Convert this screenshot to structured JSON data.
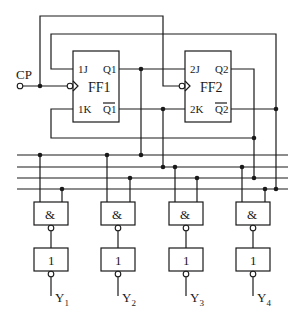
{
  "diagram": {
    "type": "digital-logic-circuit",
    "clock_input": {
      "label": "CP"
    },
    "flip_flops": [
      {
        "name": "FF1",
        "inputs": [
          "1J",
          "1K"
        ],
        "outputs": [
          "Q1",
          "Q1"
        ],
        "output_bar": [
          false,
          true
        ]
      },
      {
        "name": "FF2",
        "inputs": [
          "2J",
          "2K"
        ],
        "outputs": [
          "Q2",
          "Q2"
        ],
        "output_bar": [
          false,
          true
        ]
      }
    ],
    "bus_lines": [
      "Q1",
      "Q1_bar",
      "Q2",
      "Q2_bar"
    ],
    "decoder": {
      "nand_gates": [
        {
          "symbol": "&",
          "inputs": [
            "Q1",
            "Q2_bar"
          ]
        },
        {
          "symbol": "&",
          "inputs": [
            "Q1",
            "Q2"
          ]
        },
        {
          "symbol": "&",
          "inputs": [
            "Q1_bar",
            "Q2"
          ]
        },
        {
          "symbol": "&",
          "inputs": [
            "Q1_bar",
            "Q2_bar"
          ]
        }
      ],
      "inverters": [
        {
          "symbol": "1"
        },
        {
          "symbol": "1"
        },
        {
          "symbol": "1"
        },
        {
          "symbol": "1"
        }
      ],
      "outputs": [
        {
          "label": "Y",
          "sub": "1"
        },
        {
          "label": "Y",
          "sub": "2"
        },
        {
          "label": "Y",
          "sub": "3"
        },
        {
          "label": "Y",
          "sub": "4"
        }
      ]
    },
    "connections": [
      "CP -> FF1.C1, FF2.C1",
      "Q1 -> 2J",
      "Q1_bar -> 2K",
      "Q2 -> 1K",
      "Q2_bar -> 1J"
    ]
  }
}
